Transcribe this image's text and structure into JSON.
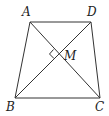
{
  "diagram": {
    "type": "geometry",
    "shape": "trapezoid",
    "stroke_color": "#333333",
    "points": {
      "A": {
        "label": "A",
        "x": 30,
        "y": 22
      },
      "D": {
        "label": "D",
        "x": 91,
        "y": 22
      },
      "B": {
        "label": "B",
        "x": 15,
        "y": 98
      },
      "C": {
        "label": "C",
        "x": 100,
        "y": 98
      },
      "M": {
        "label": "M",
        "x": 58,
        "y": 54
      }
    },
    "segments": [
      "AD",
      "AB",
      "DC",
      "BC",
      "AC",
      "BD"
    ],
    "annotations": [
      {
        "type": "right-angle",
        "at": "M",
        "between": [
          "MA",
          "MB"
        ]
      }
    ]
  }
}
